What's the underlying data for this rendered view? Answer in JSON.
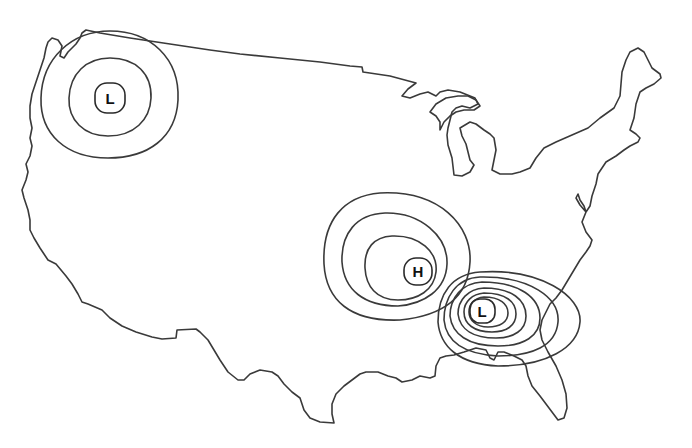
{
  "map": {
    "type": "weather-map",
    "region": "Contiguous United States",
    "background_color": "#ffffff",
    "line_color": "#3a3a3a"
  },
  "pressure_systems": [
    {
      "id": "low-northwest",
      "label": "L",
      "kind": "low",
      "x": 110,
      "y": 98,
      "isobar_count": 3
    },
    {
      "id": "high-central",
      "label": "H",
      "kind": "high",
      "x": 418,
      "y": 271,
      "isobar_count": 3
    },
    {
      "id": "low-southeast",
      "label": "L",
      "kind": "low",
      "x": 482,
      "y": 311,
      "isobar_count": 7
    }
  ]
}
